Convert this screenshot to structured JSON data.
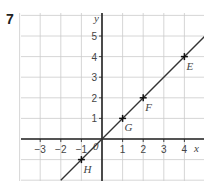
{
  "question": {
    "number": "7"
  },
  "axes": {
    "x_label": "x",
    "y_label": "y",
    "origin_label": "0"
  },
  "x_ticks": [
    {
      "label": "−3",
      "v": -3
    },
    {
      "label": "−2",
      "v": -2
    },
    {
      "label": "−1",
      "v": -1
    },
    {
      "label": "1",
      "v": 1
    },
    {
      "label": "2",
      "v": 2
    },
    {
      "label": "3",
      "v": 3
    },
    {
      "label": "4",
      "v": 4
    }
  ],
  "y_ticks": [
    {
      "label": "1",
      "v": 1
    },
    {
      "label": "2",
      "v": 2
    },
    {
      "label": "3",
      "v": 3
    },
    {
      "label": "4",
      "v": 4
    },
    {
      "label": "5",
      "v": 5
    }
  ],
  "points": [
    {
      "label": "E",
      "x": 4,
      "y": 4
    },
    {
      "label": "F",
      "x": 2,
      "y": 2
    },
    {
      "label": "G",
      "x": 1,
      "y": 1
    },
    {
      "label": "H",
      "x": -1,
      "y": -1
    }
  ],
  "line": {
    "equation": "y = x",
    "color": "#333333"
  },
  "colors": {
    "grid": "#cccccc",
    "axis": "#222222",
    "line": "#333333"
  },
  "chart_data": {
    "type": "line",
    "title": "",
    "xlabel": "x",
    "ylabel": "y",
    "xlim": [
      -4,
      5
    ],
    "ylim": [
      -2,
      6
    ],
    "grid": true,
    "series": [
      {
        "name": "y = x",
        "x": [
          -2,
          5
        ],
        "y": [
          -2,
          5
        ]
      }
    ],
    "points": [
      {
        "label": "E",
        "x": 4,
        "y": 4
      },
      {
        "label": "F",
        "x": 2,
        "y": 2
      },
      {
        "label": "G",
        "x": 1,
        "y": 1
      },
      {
        "label": "H",
        "x": -1,
        "y": -1
      }
    ]
  }
}
